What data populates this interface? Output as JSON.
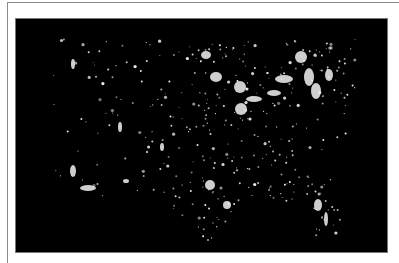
{
  "image": {
    "subject": "Night-time satellite view of city lights across the contiguous United States",
    "background_color": "#000000",
    "light_color": "#f2f2f2",
    "frame_color": "#8a8a8a",
    "width": 373,
    "height": 235
  },
  "lights": {
    "clusters": [
      {
        "x": 190,
        "y": 36,
        "rx": 5,
        "ry": 4
      },
      {
        "x": 200,
        "y": 58,
        "rx": 6,
        "ry": 5
      },
      {
        "x": 224,
        "y": 68,
        "rx": 6,
        "ry": 6
      },
      {
        "x": 238,
        "y": 80,
        "rx": 8,
        "ry": 3
      },
      {
        "x": 225,
        "y": 90,
        "rx": 6,
        "ry": 6
      },
      {
        "x": 285,
        "y": 38,
        "rx": 6,
        "ry": 6
      },
      {
        "x": 293,
        "y": 58,
        "rx": 5,
        "ry": 9
      },
      {
        "x": 300,
        "y": 72,
        "rx": 5,
        "ry": 8
      },
      {
        "x": 313,
        "y": 56,
        "rx": 4,
        "ry": 6
      },
      {
        "x": 268,
        "y": 60,
        "rx": 9,
        "ry": 4
      },
      {
        "x": 258,
        "y": 74,
        "rx": 7,
        "ry": 3
      },
      {
        "x": 194,
        "y": 166,
        "rx": 5,
        "ry": 5
      },
      {
        "x": 211,
        "y": 186,
        "rx": 4,
        "ry": 4
      },
      {
        "x": 302,
        "y": 186,
        "rx": 4,
        "ry": 6
      },
      {
        "x": 310,
        "y": 200,
        "rx": 2,
        "ry": 7
      },
      {
        "x": 57,
        "y": 152,
        "rx": 3,
        "ry": 6
      },
      {
        "x": 72,
        "y": 169,
        "rx": 8,
        "ry": 3
      },
      {
        "x": 110,
        "y": 162,
        "rx": 3,
        "ry": 2
      },
      {
        "x": 57,
        "y": 45,
        "rx": 2,
        "ry": 5
      },
      {
        "x": 104,
        "y": 108,
        "rx": 2,
        "ry": 5
      },
      {
        "x": 146,
        "y": 128,
        "rx": 2,
        "ry": 4
      }
    ],
    "dot_seed": 20240101,
    "dot_count": 620
  }
}
